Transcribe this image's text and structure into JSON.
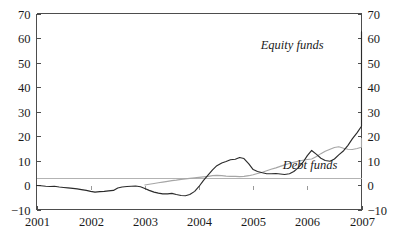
{
  "chart_data": {
    "type": "line",
    "title": "",
    "subtitle": "",
    "xlabel": "",
    "ylabel": "",
    "xlim": [
      2001,
      2007
    ],
    "ylim": [
      -10,
      70
    ],
    "grid": false,
    "legend_position": "inline-annotation",
    "x_tick_labels": [
      "2001",
      "2002",
      "2003",
      "2004",
      "2005",
      "2006",
      "2007"
    ],
    "x_ticks": [
      2001,
      2002,
      2003,
      2004,
      2005,
      2006,
      2007
    ],
    "y_tick_labels_left": [
      "70",
      "60",
      "50",
      "40",
      "30",
      "20",
      "10",
      "0",
      "−10"
    ],
    "y_tick_labels_right": [
      "70",
      "60",
      "50",
      "40",
      "30",
      "20",
      "10",
      "0",
      "−10"
    ],
    "y_ticks": [
      70,
      60,
      50,
      40,
      30,
      20,
      10,
      0,
      -10
    ],
    "annotations": [
      {
        "text": "Equity funds",
        "x": 2005.72,
        "y": 55.5
      },
      {
        "text": "Debt funds",
        "x": 2006.05,
        "y": 6.5
      }
    ],
    "series": [
      {
        "name": "Equity funds",
        "color": "#2b2b2b",
        "x": [
          2001.0,
          2001.08,
          2001.17,
          2001.25,
          2001.33,
          2001.42,
          2001.5,
          2001.58,
          2001.67,
          2001.75,
          2001.83,
          2001.92,
          2002.0,
          2002.08,
          2002.17,
          2002.25,
          2002.33,
          2002.42,
          2002.5,
          2002.58,
          2002.67,
          2002.75,
          2002.83,
          2002.92,
          2003.0,
          2003.08,
          2003.17,
          2003.25,
          2003.33,
          2003.42,
          2003.5,
          2003.58,
          2003.67,
          2003.75,
          2003.83,
          2003.92,
          2004.0,
          2004.08,
          2004.17,
          2004.25,
          2004.33,
          2004.42,
          2004.5,
          2004.58,
          2004.67,
          2004.75,
          2004.83,
          2004.92,
          2005.0,
          2005.08,
          2005.17,
          2005.25,
          2005.33,
          2005.42,
          2005.5,
          2005.58,
          2005.67,
          2005.75,
          2005.83,
          2005.92,
          2006.0,
          2006.08,
          2006.17,
          2006.25,
          2006.33,
          2006.42,
          2006.5,
          2006.58,
          2006.67,
          2006.75,
          2006.83,
          2006.92,
          2007.0
        ],
        "y": [
          -0.2,
          -0.3,
          -0.5,
          -0.6,
          -0.5,
          -0.8,
          -1.0,
          -1.2,
          -1.4,
          -1.6,
          -1.9,
          -2.2,
          -2.6,
          -2.9,
          -2.7,
          -2.6,
          -2.4,
          -2.2,
          -1.2,
          -0.8,
          -0.6,
          -0.5,
          -0.4,
          -0.7,
          -1.4,
          -2.2,
          -2.9,
          -3.3,
          -3.6,
          -3.6,
          -3.4,
          -3.9,
          -4.3,
          -4.4,
          -3.9,
          -2.6,
          -0.6,
          1.8,
          4.1,
          6.2,
          7.9,
          9.0,
          9.6,
          10.3,
          10.5,
          11.2,
          10.8,
          8.6,
          6.3,
          5.5,
          5.0,
          4.6,
          4.6,
          4.7,
          4.5,
          4.3,
          4.6,
          5.5,
          7.0,
          9.3,
          12.0,
          14.1,
          12.5,
          10.9,
          10.0,
          9.7,
          10.6,
          12.3,
          14.0,
          16.2,
          18.8,
          21.4,
          24.0
        ],
        "y_extended": [
          26.5,
          30.0,
          34.5,
          39.5,
          44.5,
          49.5,
          54.5,
          59.5,
          62.6,
          57.5,
          51.0,
          47.0,
          46.3,
          47.3,
          46.4,
          47.4,
          45.8,
          44.3,
          45.4,
          47.4,
          49.0,
          50.2,
          51.5,
          53.0,
          55.6,
          57.0,
          54.5
        ],
        "last_value": 56.8,
        "peak_value": 62.6,
        "peak_x": 2006.35,
        "min_value": -4.4
      },
      {
        "name": "Debt funds",
        "color": "#a6a6a6",
        "x": [
          2003.0,
          2003.08,
          2003.17,
          2003.25,
          2003.33,
          2003.42,
          2003.5,
          2003.58,
          2003.67,
          2003.75,
          2003.83,
          2003.92,
          2004.0,
          2004.08,
          2004.17,
          2004.25,
          2004.33,
          2004.42,
          2004.5,
          2004.58,
          2004.67,
          2004.75,
          2004.83,
          2004.92,
          2005.0,
          2005.08,
          2005.17,
          2005.25,
          2005.33,
          2005.42,
          2005.5,
          2005.58,
          2005.67,
          2005.75,
          2005.83,
          2005.92,
          2006.0,
          2006.08,
          2006.17,
          2006.25,
          2006.33,
          2006.42,
          2006.5,
          2006.58,
          2006.67,
          2006.75,
          2006.83,
          2006.92,
          2007.0
        ],
        "y": [
          0.0,
          0.3,
          0.6,
          0.9,
          1.2,
          1.5,
          1.8,
          2.0,
          2.3,
          2.5,
          2.7,
          2.9,
          3.1,
          3.3,
          3.5,
          3.8,
          3.9,
          3.8,
          3.6,
          3.5,
          3.5,
          3.4,
          3.5,
          3.8,
          4.2,
          4.7,
          5.2,
          5.8,
          6.4,
          7.0,
          7.6,
          8.2,
          8.8,
          9.3,
          9.7,
          10.1,
          10.4,
          10.6,
          11.6,
          12.8,
          13.8,
          14.6,
          15.3,
          15.6,
          15.0,
          14.6,
          14.5,
          14.9,
          15.4
        ],
        "y_extended": [
          16.0,
          16.6,
          17.2,
          17.8,
          18.4,
          18.9
        ],
        "last_value": 18.9,
        "start_x": 2003.0,
        "start_value": 0.0
      }
    ]
  },
  "axes": {
    "left_label_top": "70",
    "left_label_bottom": "−10",
    "right_label_top": "70",
    "right_label_bottom": "−10"
  }
}
